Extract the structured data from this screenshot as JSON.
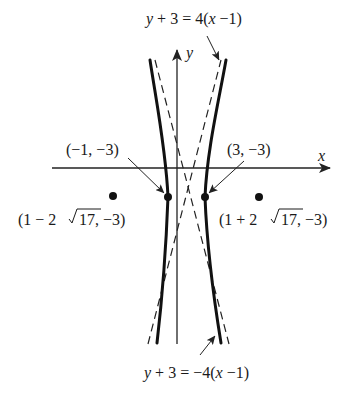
{
  "figure": {
    "axes": {
      "x_label": "x",
      "y_label": "y"
    },
    "asymptotes": [
      {
        "id": "upper-label",
        "label": "y + 3 = 4(x −1)",
        "parts": [
          "y",
          " + 3 = 4(",
          "x",
          " −1)"
        ]
      },
      {
        "id": "lower-label",
        "label": "y + 3 = −4(x −1)",
        "parts": [
          "y",
          " + 3 = −4(",
          "x",
          " −1)"
        ]
      }
    ],
    "vertices": [
      {
        "label": "(−1, −3)",
        "x": -1,
        "y": -3
      },
      {
        "label": "(3, −3)",
        "x": 3,
        "y": -3
      }
    ],
    "foci": [
      {
        "label": "(1 − 2√17, −3)",
        "prefix": "(1 − 2",
        "radical": "17",
        "suffix": ", −3)"
      },
      {
        "label": "(1 + 2√17, −3)",
        "prefix": "(1 + 2",
        "radical": "17",
        "suffix": ", −3)"
      }
    ],
    "colors": {
      "stroke": "#111111",
      "background": "#ffffff"
    }
  }
}
